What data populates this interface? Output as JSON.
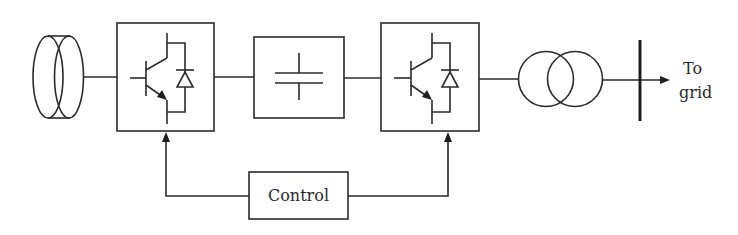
{
  "diagram": {
    "title": "",
    "blocks": [
      {
        "id": "generator",
        "kind": "generator",
        "label": ""
      },
      {
        "id": "converter-1",
        "kind": "igbt-converter",
        "label": ""
      },
      {
        "id": "dc-link",
        "kind": "capacitor",
        "label": ""
      },
      {
        "id": "converter-2",
        "kind": "igbt-converter",
        "label": ""
      },
      {
        "id": "transformer",
        "kind": "transformer",
        "label": ""
      },
      {
        "id": "bus",
        "kind": "bus-bar",
        "label": ""
      },
      {
        "id": "control",
        "kind": "block",
        "label": "Control"
      }
    ],
    "labels": {
      "control": "Control",
      "output_line1": "To",
      "output_line2": "grid"
    },
    "connections": [
      {
        "from": "generator",
        "to": "converter-1"
      },
      {
        "from": "converter-1",
        "to": "dc-link"
      },
      {
        "from": "dc-link",
        "to": "converter-2"
      },
      {
        "from": "converter-2",
        "to": "transformer"
      },
      {
        "from": "transformer",
        "to": "bus"
      },
      {
        "from": "bus",
        "to": "grid",
        "arrow": true
      },
      {
        "from": "control",
        "to": "converter-1",
        "arrow": true
      },
      {
        "from": "control",
        "to": "converter-2",
        "arrow": true
      }
    ],
    "colors": {
      "line": "#2b2b2b",
      "background": "#ffffff"
    }
  }
}
